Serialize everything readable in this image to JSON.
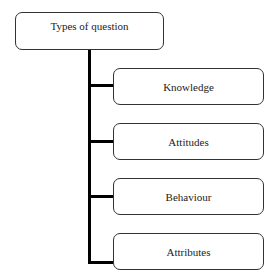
{
  "diagram": {
    "root": {
      "label": "Types of question"
    },
    "children": [
      {
        "label": "Knowledge"
      },
      {
        "label": "Attitudes"
      },
      {
        "label": "Behaviour"
      },
      {
        "label": "Attributes"
      }
    ]
  }
}
